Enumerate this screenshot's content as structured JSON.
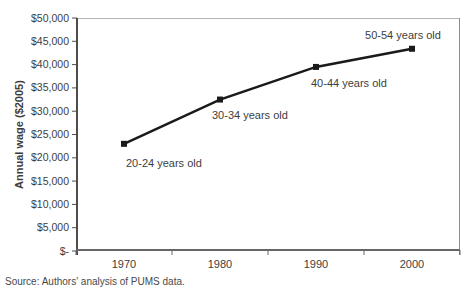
{
  "chart_data": {
    "type": "line",
    "categories": [
      "1970",
      "1980",
      "1990",
      "2000"
    ],
    "series": [
      {
        "name": "Annual wage",
        "values": [
          23000,
          32500,
          39500,
          43400
        ]
      }
    ],
    "point_labels": [
      "20-24 years old",
      "30-34 years old",
      "40-44 years old",
      "50-54 years old"
    ],
    "xlabel": "",
    "ylabel": "Annual wage ($2005)",
    "ylim": [
      0,
      50000
    ],
    "y_tick_step": 5000,
    "y_tick_labels": [
      "$-",
      "$5,000",
      "$10,000",
      "$15,000",
      "$20,000",
      "$25,000",
      "$30,000",
      "$35,000",
      "$40,000",
      "$45,000",
      "$50,000"
    ],
    "grid": false,
    "legend": "none",
    "line_color": "#1a1a1a",
    "marker": "square",
    "marker_color": "#1a1a1a"
  },
  "footer": {
    "source_note": "Source: Authors' analysis of PUMS data."
  }
}
